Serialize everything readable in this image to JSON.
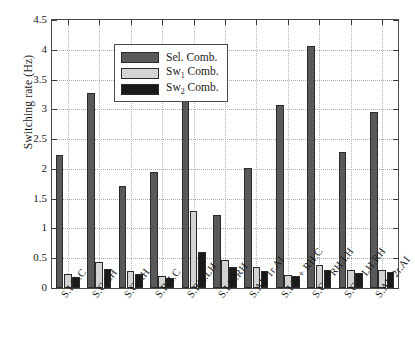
{
  "chart_data": {
    "type": "bar",
    "title": "",
    "xlabel": "",
    "ylabel": "Switching rate (Hz)",
    "ylim": [
      0,
      4.5
    ],
    "ytick_step": 0.5,
    "yticks": [
      "0",
      "0.5",
      "1",
      "1.5",
      "2",
      "2.5",
      "3",
      "3.5",
      "4",
      "4.5"
    ],
    "grid": true,
    "legend_position": "upper left",
    "categories": [
      "S.LH.C",
      "S.C.LH",
      "S.C.RH",
      "S.RH.C",
      "S.RH.LH",
      "S.LH.RH",
      "S.AI−1r.AI",
      "S.LH + RH.C",
      "S.C + RH.LH",
      "S.C + LH.RH",
      "S.AI−2r.AI"
    ],
    "series": [
      {
        "name": "Sel. Comb.",
        "color": "#595959",
        "values": [
          2.23,
          3.28,
          1.72,
          1.95,
          3.19,
          1.23,
          2.02,
          3.07,
          4.07,
          2.28,
          2.95
        ]
      },
      {
        "name": "Sw1 Comb.",
        "color": "#d4d4d4",
        "values": [
          0.23,
          0.43,
          0.28,
          0.21,
          1.3,
          0.47,
          0.35,
          0.22,
          0.38,
          0.3,
          0.31
        ]
      },
      {
        "name": "Sw2 Comb.",
        "color": "#1a1a1a",
        "values": [
          0.19,
          0.32,
          0.23,
          0.17,
          0.6,
          0.36,
          0.28,
          0.2,
          0.3,
          0.26,
          0.27
        ]
      }
    ]
  },
  "legend": {
    "entries": [
      {
        "label_main": "Sel.",
        "label_sub": "",
        "label_tail": "Comb."
      },
      {
        "label_main": "Sw",
        "label_sub": "1",
        "label_tail": "Comb."
      },
      {
        "label_main": "Sw",
        "label_sub": "2",
        "label_tail": "Comb."
      }
    ]
  }
}
